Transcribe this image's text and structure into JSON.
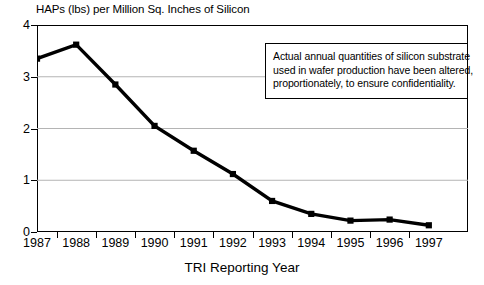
{
  "chart_data": {
    "type": "line",
    "title": "HAPs (lbs) per Million Sq. Inches of Silicon",
    "xlabel": "TRI Reporting Year",
    "ylabel": "",
    "categories": [
      "1987",
      "1988",
      "1989",
      "1990",
      "1991",
      "1992",
      "1993",
      "1994",
      "1995",
      "1996",
      "1997"
    ],
    "values": [
      3.35,
      3.62,
      2.85,
      2.05,
      1.57,
      1.12,
      0.6,
      0.35,
      0.22,
      0.24,
      0.13
    ],
    "series": [
      {
        "name": "HAPs per Million Sq. Inches of Silicon",
        "values": [
          3.35,
          3.62,
          2.85,
          2.05,
          1.57,
          1.12,
          0.6,
          0.35,
          0.22,
          0.24,
          0.13
        ]
      }
    ],
    "ylim": [
      0,
      4
    ],
    "yticks": [
      0,
      1,
      2,
      3,
      4
    ],
    "ytick_labels": [
      "0",
      "1",
      "2",
      "3",
      "4"
    ],
    "grid": "horizontal",
    "legend": "none",
    "marker": "square",
    "line_color": "#000000",
    "grid_color": "#b4b4b4",
    "annotations": [
      {
        "lines": [
          "Actual annual quantities of silicon substrate",
          "used in wafer production have been altered,",
          "proportionately, to ensure confidentiality."
        ]
      }
    ]
  }
}
